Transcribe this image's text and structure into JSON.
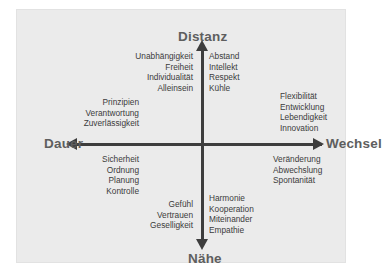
{
  "diagram": {
    "background_color": "#ebebeb",
    "axis_color": "#3d3d3d",
    "pole_label_color": "#5e5e5e",
    "word_color": "#3b3b3b",
    "poles": {
      "top": "Distanz",
      "bottom": "Nähe",
      "left": "Dauer",
      "right": "Wechsel"
    },
    "clusters": [
      {
        "id": "top-left",
        "quadrant": "distanz-dauer",
        "align": "right",
        "words": [
          "Unabhängigkeit",
          "Freiheit",
          "Individualität",
          "Alleinsein"
        ]
      },
      {
        "id": "top-right",
        "quadrant": "distanz-wechsel",
        "align": "left",
        "words": [
          "Abstand",
          "Intellekt",
          "Respekt",
          "Kühle"
        ]
      },
      {
        "id": "upper-left",
        "quadrant": "distanz-dauer",
        "align": "right",
        "words": [
          "Prinzipien",
          "Verantwortung",
          "Zuverlässigkeit"
        ]
      },
      {
        "id": "upper-right",
        "quadrant": "distanz-wechsel",
        "align": "left",
        "words": [
          "Flexibilität",
          "Entwicklung",
          "Lebendigkeit",
          "Innovation"
        ]
      },
      {
        "id": "lower-left",
        "quadrant": "naehe-dauer",
        "align": "right",
        "words": [
          "Sicherheit",
          "Ordnung",
          "Planung",
          "Kontrolle"
        ]
      },
      {
        "id": "lower-right",
        "quadrant": "naehe-wechsel",
        "align": "left",
        "words": [
          "Veränderung",
          "Abwechslung",
          "Spontanität"
        ]
      },
      {
        "id": "bottom-left",
        "quadrant": "naehe-dauer",
        "align": "right",
        "words": [
          "Gefühl",
          "Vertrauen",
          "Geselligkeit"
        ]
      },
      {
        "id": "bottom-right",
        "quadrant": "naehe-wechsel",
        "align": "left",
        "words": [
          "Harmonie",
          "Kooperation",
          "Miteinander",
          "Empathie"
        ]
      }
    ]
  }
}
